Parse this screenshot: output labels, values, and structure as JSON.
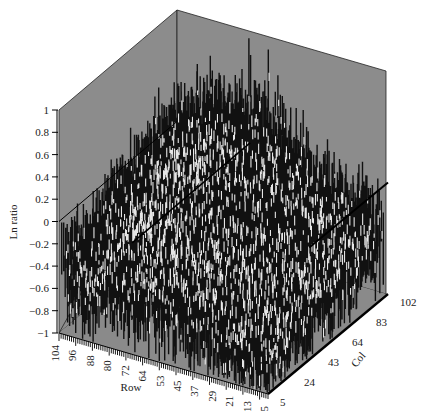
{
  "chart_data": {
    "type": "3d-surface",
    "title": "",
    "zlabel": "Ln ratio",
    "xlabel": "Row",
    "ylabel": "Col",
    "zlim": [
      -1,
      1
    ],
    "z_ticks": [
      "1",
      "0.8",
      "0.6",
      "0.4",
      "0.2",
      "0",
      "−0.2",
      "−0.4",
      "−0.6",
      "−0.8",
      "−1"
    ],
    "z_tick_values": [
      1,
      0.8,
      0.6,
      0.4,
      0.2,
      0,
      -0.2,
      -0.4,
      -0.6,
      -0.8,
      -1
    ],
    "row_ticks": [
      "104",
      "96",
      "88",
      "80",
      "72",
      "64",
      "53",
      "45",
      "37",
      "29",
      "21",
      "13",
      "5"
    ],
    "col_ticks": [
      "5",
      "24",
      "43",
      "64",
      "83",
      "102"
    ],
    "row_range": [
      5,
      104
    ],
    "col_range": [
      5,
      102
    ],
    "zero_plane": 0,
    "surface_description": "Dense spiky surface of Ln ratio values mostly between -0.8 and 1; values rise toward mid/high columns and low-middle rows, with a ridge near 0.6-1.0 in the back; front rows sit around -0.2 to -0.6",
    "value_summary": {
      "typical_min": -0.8,
      "typical_max": 1.0,
      "baseline_front": -0.3,
      "ridge_back": 0.7
    },
    "grid": false,
    "legend": null
  },
  "style": {
    "wall_color": "#8c8c8c",
    "floor_color": "#8a8a8a",
    "spike_dark": "#111111",
    "spike_light": "#e6e6e6",
    "line_color": "#000000"
  }
}
